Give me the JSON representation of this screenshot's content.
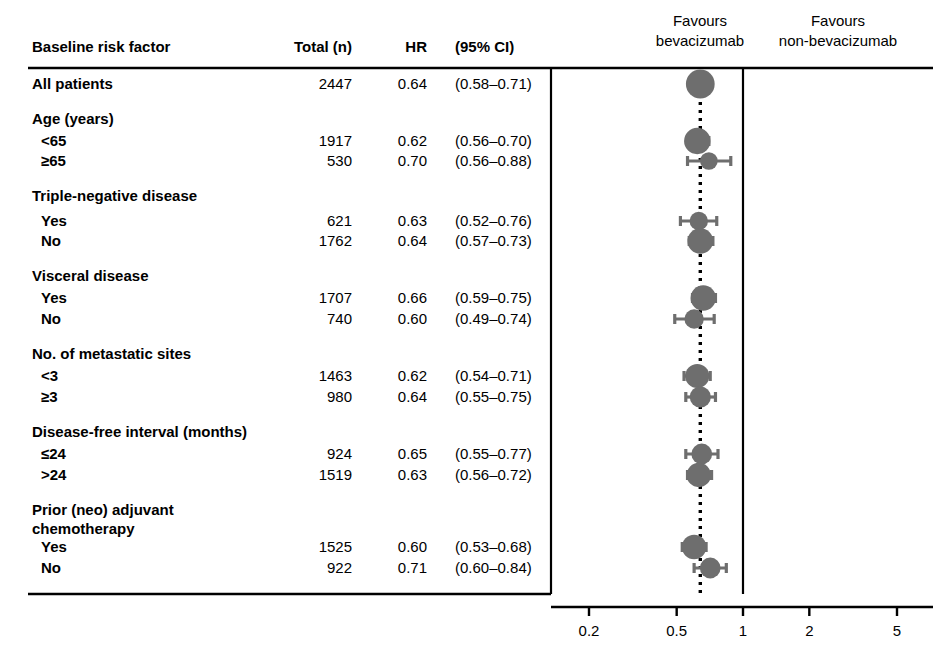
{
  "table": {
    "headers": {
      "factor": "Baseline risk factor",
      "total": "Total (n)",
      "hr": "HR",
      "ci": "(95% CI)"
    }
  },
  "legend": {
    "left_line1": "Favours",
    "left_line2": "bevacizumab",
    "right_line1": "Favours",
    "right_line2": "non-bevacizumab"
  },
  "axis": {
    "ticks": [
      "0.2",
      "0.5",
      "1",
      "2",
      "5"
    ],
    "tick_values": [
      0.2,
      0.5,
      1,
      2,
      5
    ],
    "scale": "log",
    "reference_line_value": 1,
    "dotted_line_value": 0.64
  },
  "colors": {
    "marker": "#6e6e6e",
    "line": "#000000",
    "background": "#ffffff"
  },
  "chart_data": {
    "type": "scatter",
    "title": "",
    "xlabel": "",
    "ylabel": "",
    "xscale": "log",
    "xlim": [
      0.2,
      5
    ],
    "xticks": [
      0.2,
      0.5,
      1,
      2,
      5
    ],
    "xticklabels": [
      "0.2",
      "0.5",
      "1",
      "2",
      "5"
    ],
    "grid": false,
    "legend_position": "top",
    "reference_line": 1,
    "dotted_reference_line": 0.64,
    "annotations": [
      "Favours bevacizumab",
      "Favours non-bevacizumab"
    ],
    "columns": [
      "Baseline risk factor",
      "Total (n)",
      "HR",
      "(95% CI)"
    ],
    "rows": [
      {
        "kind": "row",
        "label": "All patients",
        "indent": 0,
        "total": "2447",
        "hr": "0.64",
        "ci": "(0.58–0.71)",
        "hr_value": 0.64,
        "ci_low": 0.58,
        "ci_high": 0.71,
        "n": 2447
      },
      {
        "kind": "header",
        "label": "Age (years)",
        "indent": 0,
        "total": "",
        "hr": "",
        "ci": ""
      },
      {
        "kind": "row",
        "label": "<65",
        "indent": 1,
        "total": "1917",
        "hr": "0.62",
        "ci": "(0.56–0.70)",
        "hr_value": 0.62,
        "ci_low": 0.56,
        "ci_high": 0.7,
        "n": 1917
      },
      {
        "kind": "row",
        "label": "≥65",
        "indent": 1,
        "total": "530",
        "hr": "0.70",
        "ci": "(0.56–0.88)",
        "hr_value": 0.7,
        "ci_low": 0.56,
        "ci_high": 0.88,
        "n": 530
      },
      {
        "kind": "header",
        "label": "Triple-negative disease",
        "indent": 0,
        "total": "",
        "hr": "",
        "ci": ""
      },
      {
        "kind": "row",
        "label": "Yes",
        "indent": 1,
        "total": "621",
        "hr": "0.63",
        "ci": "(0.52–0.76)",
        "hr_value": 0.63,
        "ci_low": 0.52,
        "ci_high": 0.76,
        "n": 621
      },
      {
        "kind": "row",
        "label": "No",
        "indent": 1,
        "total": "1762",
        "hr": "0.64",
        "ci": "(0.57–0.73)",
        "hr_value": 0.64,
        "ci_low": 0.57,
        "ci_high": 0.73,
        "n": 1762
      },
      {
        "kind": "header",
        "label": "Visceral disease",
        "indent": 0,
        "total": "",
        "hr": "",
        "ci": ""
      },
      {
        "kind": "row",
        "label": "Yes",
        "indent": 1,
        "total": "1707",
        "hr": "0.66",
        "ci": "(0.59–0.75)",
        "hr_value": 0.66,
        "ci_low": 0.59,
        "ci_high": 0.75,
        "n": 1707
      },
      {
        "kind": "row",
        "label": "No",
        "indent": 1,
        "total": "740",
        "hr": "0.60",
        "ci": "(0.49–0.74)",
        "hr_value": 0.6,
        "ci_low": 0.49,
        "ci_high": 0.74,
        "n": 740
      },
      {
        "kind": "header",
        "label": "No. of metastatic sites",
        "indent": 0,
        "total": "",
        "hr": "",
        "ci": ""
      },
      {
        "kind": "row",
        "label": "<3",
        "indent": 1,
        "total": "1463",
        "hr": "0.62",
        "ci": "(0.54–0.71)",
        "hr_value": 0.62,
        "ci_low": 0.54,
        "ci_high": 0.71,
        "n": 1463
      },
      {
        "kind": "row",
        "label": "≥3",
        "indent": 1,
        "total": "980",
        "hr": "0.64",
        "ci": "(0.55–0.75)",
        "hr_value": 0.64,
        "ci_low": 0.55,
        "ci_high": 0.75,
        "n": 980
      },
      {
        "kind": "header",
        "label": "Disease-free interval (months)",
        "indent": 0,
        "total": "",
        "hr": "",
        "ci": ""
      },
      {
        "kind": "row",
        "label": "≤24",
        "indent": 1,
        "total": "924",
        "hr": "0.65",
        "ci": "(0.55–0.77)",
        "hr_value": 0.65,
        "ci_low": 0.55,
        "ci_high": 0.77,
        "n": 924
      },
      {
        "kind": "row",
        "label": ">24",
        "indent": 1,
        "total": "1519",
        "hr": "0.63",
        "ci": "(0.56–0.72)",
        "hr_value": 0.63,
        "ci_low": 0.56,
        "ci_high": 0.72,
        "n": 1519
      },
      {
        "kind": "header",
        "label": "Prior (neo) adjuvant",
        "indent": 0,
        "total": "",
        "hr": "",
        "ci": ""
      },
      {
        "kind": "header",
        "label": "chemotherapy",
        "indent": 0,
        "total": "",
        "hr": "",
        "ci": ""
      },
      {
        "kind": "row",
        "label": "Yes",
        "indent": 1,
        "total": "1525",
        "hr": "0.60",
        "ci": "(0.53–0.68)",
        "hr_value": 0.6,
        "ci_low": 0.53,
        "ci_high": 0.68,
        "n": 1525
      },
      {
        "kind": "row",
        "label": "No",
        "indent": 1,
        "total": "922",
        "hr": "0.71",
        "ci": "(0.60–0.84)",
        "hr_value": 0.71,
        "ci_low": 0.6,
        "ci_high": 0.84,
        "n": 922
      }
    ]
  }
}
